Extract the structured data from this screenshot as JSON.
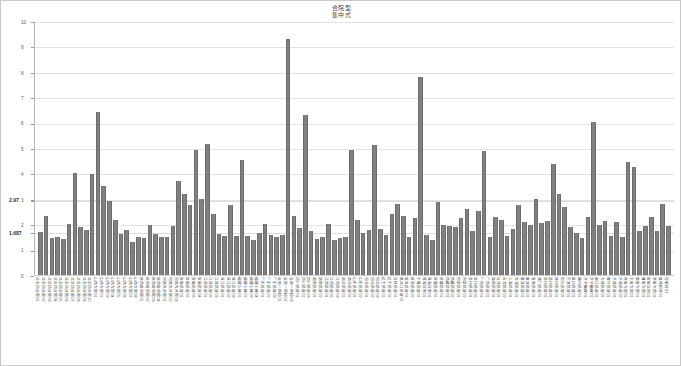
{
  "chart_data": {
    "type": "bar",
    "title": "合院型\n集中式",
    "title_lines": [
      "合院型",
      "集中式"
    ],
    "xlabel": "",
    "ylabel": "",
    "ylim": [
      0,
      10
    ],
    "grid": true,
    "legend": "none",
    "bar_color": "#808080",
    "gridline_color": "#e3e3e3",
    "y_ticks": [
      {
        "value": 10,
        "label": "10",
        "emphasis": false
      },
      {
        "value": 9,
        "label": "9",
        "emphasis": false
      },
      {
        "value": 8,
        "label": "8",
        "emphasis": false
      },
      {
        "value": 7,
        "label": "7",
        "emphasis": false
      },
      {
        "value": 6,
        "label": "6",
        "emphasis": false
      },
      {
        "value": 5,
        "label": "5",
        "emphasis": false
      },
      {
        "value": 4,
        "label": "4",
        "emphasis": false
      },
      {
        "value": 3,
        "label": "3",
        "emphasis": false
      },
      {
        "value": 2.97,
        "label": "2.97",
        "emphasis": true
      },
      {
        "value": 2,
        "label": "2",
        "emphasis": false
      },
      {
        "value": 1.687,
        "label": "1.687",
        "emphasis": true
      },
      {
        "value": 1,
        "label": "1",
        "emphasis": false
      },
      {
        "value": 0,
        "label": "0",
        "emphasis": false
      }
    ],
    "reference_lines": [
      {
        "value": 2.97,
        "label": "2.97"
      },
      {
        "value": 1.687,
        "label": "1.687"
      }
    ],
    "categories": [
      "北京四合院01",
      "北京四合院02",
      "北京四合院03",
      "北京四合院04",
      "北京四合院05",
      "北京四合院06",
      "北京四合院07",
      "北京四合院08",
      "北京四合院09",
      "北京四合院10",
      "山西大院01",
      "山西大院02",
      "山西大院03",
      "山西大院04",
      "山西大院05",
      "山西大院06",
      "山西大院07",
      "山西大院08",
      "陕西窑洞院01",
      "陕西窑洞院02",
      "陕西窑洞院03",
      "陕西窑洞院04",
      "河南天井院01",
      "河南天井院02",
      "河南天井院03",
      "安徽民居01",
      "安徽民居02",
      "安徽民居03",
      "安徽民居04",
      "江苏民居01",
      "江苏民居02",
      "江苏民居03",
      "浙江民居01",
      "浙江民居02",
      "浙江民居03",
      "福建土楼01",
      "福建土楼02",
      "福建土楼03",
      "福建土楼04",
      "广东民居01",
      "广东民居02",
      "广东民居03",
      "云南一颗印01",
      "云南一颗印02",
      "云南一颗印03",
      "四川民居01",
      "四川民居02",
      "四川民居03",
      "湖南民居01",
      "湖南民居02",
      "江西民居01",
      "江西民居02",
      "江西民居03",
      "湖北民居01",
      "湖北民居02",
      "山东民居01",
      "山东民居02",
      "河北民居01",
      "河北民居02",
      "河北民居03",
      "辽宁民居01",
      "辽宁民居02",
      "吉林民居01",
      "黑龙江民居01",
      "甘肃民居01",
      "甘肃民居02",
      "宁夏民居01",
      "青海庄廓01",
      "青海庄廓02",
      "新疆民居01",
      "新疆民居02",
      "西藏民居01",
      "西藏民居02",
      "内蒙民居01",
      "内蒙民居02",
      "贵州民居01",
      "贵州民居02",
      "广西民居01",
      "广西民居02",
      "海南民居01",
      "台湾民居01",
      "台湾民居02",
      "上海民居01",
      "天津民居01",
      "重庆民居01",
      "重庆民居02",
      "香港民居01",
      "澳门民居01",
      "苏州民居01",
      "苏州民居02",
      "扬州民居01",
      "绍兴民居01",
      "宁波民居01",
      "泉州民居01",
      "潮州民居01",
      "开平碉楼01",
      "开平碉楼02",
      "丽江民居01",
      "大理民居01",
      "喀什民居01",
      "平遥民居01",
      "平遥民居02",
      "乔家大院01",
      "王家大院01",
      "渠家大院01",
      "曹家大院01",
      "常家庄园01",
      "李家大院01",
      "皇城相府01",
      "党家村01"
    ],
    "values": [
      1.72,
      2.38,
      1.51,
      1.53,
      1.46,
      2.04,
      4.04,
      1.94,
      1.8,
      4.02,
      6.46,
      3.54,
      2.97,
      2.2,
      1.64,
      1.8,
      1.33,
      1.52,
      1.48,
      2.02,
      1.66,
      1.52,
      1.54,
      1.96,
      3.74,
      3.24,
      2.8,
      4.98,
      3.02,
      5.2,
      2.46,
      1.65,
      1.56,
      2.78,
      1.58,
      4.58,
      1.56,
      1.42,
      1.68,
      2.05,
      1.62,
      1.53,
      1.6,
      9.32,
      2.36,
      1.88,
      6.32,
      1.78,
      1.46,
      1.52,
      2.03,
      1.4,
      1.49,
      1.55,
      4.95,
      2.2,
      1.71,
      1.82,
      5.15,
      1.86,
      1.61,
      2.44,
      2.83,
      2.36,
      1.52,
      2.3,
      7.82,
      1.62,
      1.43,
      2.9,
      2.0,
      1.95,
      1.92,
      2.3,
      2.64,
      1.78,
      2.56,
      4.92,
      1.54,
      2.33,
      2.19,
      1.56,
      1.85,
      2.8,
      2.11,
      2.0,
      3.04,
      2.08,
      2.17,
      4.4,
      3.22,
      2.7,
      1.94,
      1.7,
      1.5,
      2.34,
      6.06,
      2.0,
      2.17,
      1.57,
      2.12,
      1.53,
      4.48,
      4.28,
      1.78,
      1.96,
      2.34,
      1.76,
      2.82,
      1.96
    ]
  }
}
